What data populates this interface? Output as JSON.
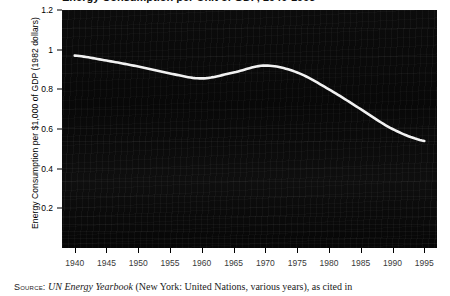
{
  "title": {
    "text": "Energy Consumption per Unit of GDP, 1940-1995",
    "clipped": true
  },
  "axes": {
    "y_label": "Energy Consumption per $1,000 of GDP (1982 dollars)",
    "y_ticks": [
      "1.2",
      "1",
      "0.8",
      "0.6",
      "0.4",
      "0.2"
    ],
    "x_ticks": [
      "1940",
      "1945",
      "1950",
      "1955",
      "1960",
      "1965",
      "1970",
      "1975",
      "1980",
      "1985",
      "1990",
      "1995"
    ]
  },
  "source": {
    "label": "Source:",
    "italic_title": "UN Energy Yearbook",
    "rest": " (New York: United Nations, various years), as cited in"
  },
  "colors": {
    "plot_background": "#0a0a0a",
    "line": "#f2f2f2",
    "text": "#000000"
  },
  "chart_data": {
    "type": "line",
    "title": "Energy Consumption per Unit of GDP, 1940-1995",
    "xlabel": "",
    "ylabel": "Energy Consumption per $1,000 of GDP (1982 dollars)",
    "xlim": [
      1938,
      1997
    ],
    "ylim": [
      0,
      1.2
    ],
    "grid": false,
    "legend": "none",
    "x": [
      1940,
      1945,
      1950,
      1955,
      1960,
      1965,
      1970,
      1975,
      1980,
      1985,
      1990,
      1995
    ],
    "series": [
      {
        "name": "Energy consumption per $1,000 of GDP",
        "values": [
          0.97,
          0.945,
          0.915,
          0.88,
          0.855,
          0.885,
          0.92,
          0.885,
          0.8,
          0.7,
          0.6,
          0.54
        ]
      }
    ]
  }
}
